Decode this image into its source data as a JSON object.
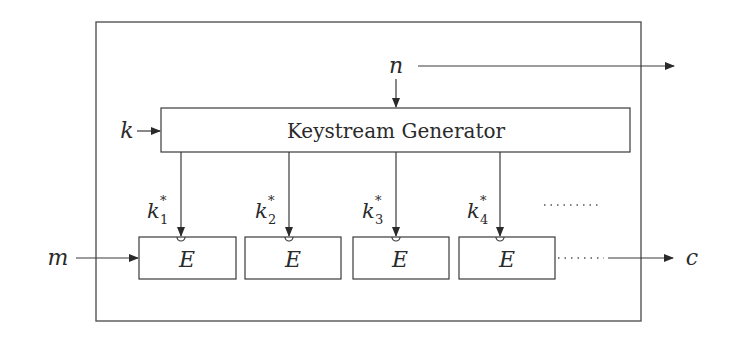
{
  "diagram": {
    "title": "",
    "generator": {
      "label": "Keystream Generator"
    },
    "inputs": {
      "key": "k",
      "nonce": "n",
      "message": "m"
    },
    "output": {
      "ciphertext": "c"
    },
    "keystream_blocks": [
      {
        "base": "k",
        "sub": "1",
        "sup": "*"
      },
      {
        "base": "k",
        "sub": "2",
        "sup": "*"
      },
      {
        "base": "k",
        "sub": "3",
        "sup": "*"
      },
      {
        "base": "k",
        "sub": "4",
        "sup": "*"
      }
    ],
    "encryption_blocks": [
      {
        "label": "E"
      },
      {
        "label": "E"
      },
      {
        "label": "E"
      },
      {
        "label": "E"
      }
    ],
    "continuation": "......"
  }
}
